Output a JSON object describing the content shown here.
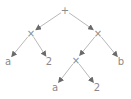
{
  "diagram": {
    "type": "expression-tree",
    "nodes": [
      {
        "id": "root",
        "label": "+",
        "x": 65,
        "y": 10
      },
      {
        "id": "mul_left",
        "label": "×",
        "x": 31,
        "y": 33
      },
      {
        "id": "mul_right",
        "label": "×",
        "x": 98,
        "y": 33
      },
      {
        "id": "a1",
        "label": "a",
        "x": 8,
        "y": 61
      },
      {
        "id": "two1",
        "label": "2",
        "x": 49,
        "y": 61
      },
      {
        "id": "mul_mid",
        "label": "×",
        "x": 76,
        "y": 60
      },
      {
        "id": "b",
        "label": "b",
        "x": 121,
        "y": 61
      },
      {
        "id": "a2",
        "label": "a",
        "x": 55,
        "y": 87
      },
      {
        "id": "two2",
        "label": "2",
        "x": 97,
        "y": 87
      }
    ],
    "edges": [
      [
        "root",
        "mul_left"
      ],
      [
        "root",
        "mul_right"
      ],
      [
        "mul_left",
        "a1"
      ],
      [
        "mul_left",
        "two1"
      ],
      [
        "mul_right",
        "mul_mid"
      ],
      [
        "mul_right",
        "b"
      ],
      [
        "mul_mid",
        "a2"
      ],
      [
        "mul_mid",
        "two2"
      ]
    ],
    "colors": {
      "text": "#8a8a8a",
      "edge": "#b8b8b8",
      "arrow": "#6a6a6a"
    }
  }
}
